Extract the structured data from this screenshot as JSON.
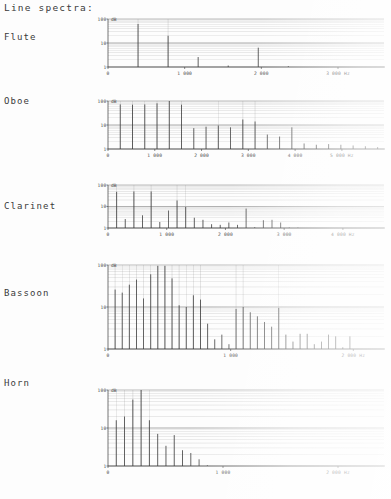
{
  "page": {
    "title": "Line spectra:"
  },
  "axis": {
    "y_unit": "dB",
    "y_ticks": [
      "1",
      "10",
      "100"
    ],
    "x_unit": "Hz"
  },
  "charts": [
    {
      "name": "Flute",
      "label": "Flute",
      "chart_data": {
        "type": "bar",
        "title": "Flute",
        "xlabel": "Hz",
        "ylabel": "dB",
        "ylim": [
          1,
          100
        ],
        "yscale": "log",
        "xlim": [
          0,
          3600
        ],
        "grid": true,
        "x_ticks": [
          0,
          1000,
          2000,
          3000
        ],
        "x_tick_labels": [
          "0",
          "1 000",
          "2 000",
          "3 000 Hz"
        ],
        "y_ticks": [
          1,
          10,
          100
        ],
        "x": [
          392,
          784,
          1176,
          1568,
          1960,
          2352,
          2744
        ],
        "values": [
          62,
          20,
          2.6,
          1.15,
          6.4,
          1.1,
          1.0
        ]
      }
    },
    {
      "name": "Oboe",
      "label": "Oboe",
      "chart_data": {
        "type": "bar",
        "title": "Oboe",
        "xlabel": "Hz",
        "ylabel": "dB",
        "ylim": [
          1,
          100
        ],
        "yscale": "log",
        "xlim": [
          0,
          5900
        ],
        "grid": true,
        "x_ticks": [
          0,
          1000,
          2000,
          3000,
          4000,
          5000
        ],
        "x_tick_labels": [
          "0",
          "1 000",
          "2 000",
          "3 000",
          "4 000",
          "5 000 Hz"
        ],
        "y_ticks": [
          1,
          10,
          100
        ],
        "x": [
          262,
          524,
          786,
          1048,
          1310,
          1572,
          1834,
          2096,
          2358,
          2620,
          2882,
          3144,
          3406,
          3668,
          3930,
          4192,
          4454,
          4716,
          4978,
          5240,
          5502,
          5764
        ],
        "values": [
          72,
          70,
          72,
          80,
          100,
          70,
          7.4,
          8.5,
          9.5,
          8.0,
          17,
          14,
          4.0,
          3.3,
          8.0,
          1.7,
          1.5,
          1.6,
          1.5,
          1.4,
          1.3,
          1.2
        ]
      }
    },
    {
      "name": "Clarinet",
      "label": "Clarinet",
      "chart_data": {
        "type": "bar",
        "title": "Clarinet",
        "xlabel": "Hz",
        "ylabel": "dB",
        "ylim": [
          1,
          100
        ],
        "yscale": "log",
        "xlim": [
          0,
          4700
        ],
        "grid": true,
        "x_ticks": [
          0,
          1000,
          2000,
          3000,
          4000
        ],
        "x_tick_labels": [
          "0",
          "1 000",
          "2 000",
          "3 000",
          "4 000 Hz"
        ],
        "y_ticks": [
          1,
          10,
          100
        ],
        "x": [
          147,
          294,
          441,
          588,
          735,
          882,
          1029,
          1176,
          1323,
          1470,
          1617,
          1764,
          1911,
          2058,
          2205,
          2352,
          2499,
          2646,
          2793,
          2940,
          3087,
          3234,
          3381,
          3528,
          3675,
          3822
        ],
        "values": [
          48,
          2.6,
          50,
          3.9,
          50,
          1.9,
          6.5,
          19,
          9.5,
          3.0,
          2.4,
          1.5,
          1.4,
          1.8,
          1.4,
          8.0,
          1.1,
          2.3,
          2.4,
          1.8,
          1.05,
          1.05,
          1.0,
          1.0,
          1.0,
          1.0
        ]
      }
    },
    {
      "name": "Bassoon",
      "label": "Bassoon",
      "chart_data": {
        "type": "bar",
        "title": "Bassoon",
        "xlabel": "Hz",
        "ylabel": "dB",
        "ylim": [
          1,
          100
        ],
        "yscale": "log",
        "xlim": [
          0,
          2250
        ],
        "grid": true,
        "x_ticks": [
          0,
          1000,
          2000
        ],
        "x_tick_labels": [
          "0",
          "1 000",
          "2 000 Hz"
        ],
        "y_ticks": [
          1,
          10,
          100
        ],
        "x": [
          58,
          116,
          174,
          232,
          290,
          348,
          406,
          464,
          522,
          580,
          638,
          696,
          754,
          812,
          870,
          928,
          986,
          1044,
          1102,
          1160,
          1218,
          1276,
          1334,
          1392,
          1450,
          1508,
          1566,
          1624,
          1682,
          1740,
          1798,
          1856,
          1914,
          1972,
          2030
        ],
        "values": [
          26,
          22,
          34,
          45,
          16,
          60,
          95,
          95,
          48,
          11,
          10,
          19,
          15,
          4.0,
          1.7,
          2.2,
          1.3,
          9.0,
          10,
          7.5,
          6.0,
          4.4,
          3.4,
          9.5,
          2.2,
          1.5,
          2.3,
          2.3,
          1.3,
          1.5,
          2.2,
          2.0,
          1.1,
          2.0,
          1.0
        ]
      }
    },
    {
      "name": "Horn",
      "label": "Horn",
      "chart_data": {
        "type": "bar",
        "title": "Horn",
        "xlabel": "Hz",
        "ylabel": "dB",
        "ylim": [
          1,
          100
        ],
        "yscale": "log",
        "xlim": [
          0,
          2400
        ],
        "grid": true,
        "x_ticks": [
          0,
          1000,
          2000
        ],
        "x_tick_labels": [
          "0",
          "1 000",
          "2 000 Hz"
        ],
        "y_ticks": [
          1,
          10,
          100
        ],
        "x": [
          72,
          144,
          216,
          288,
          360,
          432,
          504,
          576,
          648,
          720,
          792,
          864
        ],
        "values": [
          16,
          20,
          56,
          100,
          16,
          7.0,
          3.4,
          6.5,
          2.6,
          2.2,
          1.5,
          1.05
        ]
      }
    }
  ],
  "layout": {
    "chart_boxes": [
      {
        "left": 96,
        "top": 14,
        "width": 290,
        "height": 62,
        "label_top": 32
      },
      {
        "left": 96,
        "top": 96,
        "width": 290,
        "height": 62,
        "label_top": 96
      },
      {
        "left": 96,
        "top": 180,
        "width": 290,
        "height": 57,
        "label_top": 201
      },
      {
        "left": 96,
        "top": 260,
        "width": 290,
        "height": 98,
        "label_top": 288
      },
      {
        "left": 96,
        "top": 385,
        "width": 290,
        "height": 90,
        "label_top": 378
      }
    ]
  }
}
